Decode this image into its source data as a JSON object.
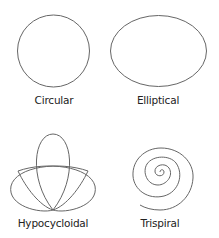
{
  "diagram": {
    "stroke_color": "#666666",
    "shapes": [
      {
        "id": "circular",
        "label": "Circular"
      },
      {
        "id": "elliptical",
        "label": "Elliptical"
      },
      {
        "id": "hypocycloidal",
        "label": "Hypocycloidal"
      },
      {
        "id": "trispiral",
        "label": "Trispiral"
      }
    ]
  }
}
